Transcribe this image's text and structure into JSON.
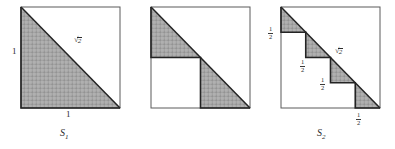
{
  "figure": {
    "background_color": "#ffffff",
    "ink_color": "#1a1a1a",
    "shade_color": "#9e9e9e",
    "outline_color": "#2b2b2b"
  },
  "glyphs": {
    "radical_sign": "√",
    "radicand": "2",
    "fraction_one": "1",
    "half_den": "2",
    "quarter_den": "4"
  },
  "panels": [
    {
      "id": "panel-1",
      "caption": "S",
      "caption_sub": "1",
      "square_side_label": "1",
      "labels": {
        "left_side": "1",
        "bottom_side": "1",
        "diagonal": "√2"
      },
      "steps": 1,
      "step_fraction_num": "1",
      "step_fraction_den": "1",
      "edge_labels": [
        {
          "name": "left-side-length",
          "text": "1",
          "kind": "integer",
          "x": 12,
          "y": 52
        },
        {
          "name": "bottom-side-length",
          "text": "1",
          "kind": "integer",
          "x": 68,
          "y": 114
        },
        {
          "name": "diagonal-length",
          "text": "√2",
          "kind": "radical",
          "x": 76,
          "y": 40
        }
      ],
      "caption_pos": {
        "x": 63,
        "y": 133
      }
    },
    {
      "id": "panel-2",
      "caption": "S",
      "caption_sub": "2",
      "square_side_label": "1",
      "labels": {
        "left_upper": "1/2",
        "interior_horizontal": "1/2",
        "interior_vertical": "1/2",
        "bottom_right": "1/2",
        "diagonal": "√2"
      },
      "steps": 2,
      "step_fraction_num": "1",
      "step_fraction_den": "2",
      "edge_labels": [
        {
          "name": "left-half-length",
          "text": "1/2",
          "kind": "fraction",
          "num": "1",
          "den": "2",
          "x": 140,
          "y": 28
        },
        {
          "name": "interior-horizontal-half",
          "text": "1/2",
          "kind": "fraction",
          "num": "1",
          "den": "2",
          "x": 172,
          "y": 61
        },
        {
          "name": "interior-vertical-half",
          "text": "1/2",
          "kind": "fraction",
          "num": "1",
          "den": "2",
          "x": 192,
          "y": 79
        },
        {
          "name": "bottom-right-half",
          "text": "1/2",
          "kind": "fraction",
          "num": "1",
          "den": "2",
          "x": 228,
          "y": 113
        },
        {
          "name": "diagonal-length",
          "text": "√2",
          "kind": "radical",
          "x": 207,
          "y": 51
        }
      ],
      "caption_pos": {
        "x": 190,
        "y": 133
      }
    },
    {
      "id": "panel-3",
      "caption": "S",
      "caption_sub": "3",
      "square_side_label": "1",
      "labels": {
        "diagonal": "√2"
      },
      "steps": 4,
      "step_fraction_num": "1",
      "step_fraction_den": "4",
      "edge_labels": [
        {
          "name": "step1-vertical-quarter",
          "text": "1/4",
          "kind": "fraction",
          "num": "1",
          "den": "4",
          "x": 271,
          "y": 20
        },
        {
          "name": "step1-horizontal-quarter",
          "text": "1/4",
          "kind": "fraction",
          "num": "1",
          "den": "4",
          "x": 290,
          "y": 41
        },
        {
          "name": "step2-vertical-quarter",
          "text": "1/4",
          "kind": "fraction",
          "num": "1",
          "den": "4",
          "x": 300,
          "y": 48
        },
        {
          "name": "step2-horizontal-quarter",
          "text": "1/4",
          "kind": "fraction",
          "num": "1",
          "den": "4",
          "x": 315,
          "y": 66
        },
        {
          "name": "step3-vertical-quarter",
          "text": "1/4",
          "kind": "fraction",
          "num": "1",
          "den": "4",
          "x": 325,
          "y": 73
        },
        {
          "name": "step3-horizontal-quarter",
          "text": "1/4",
          "kind": "fraction",
          "num": "1",
          "den": "4",
          "x": 340,
          "y": 90
        },
        {
          "name": "step4-vertical-quarter",
          "text": "1/4",
          "kind": "fraction",
          "num": "1",
          "den": "4",
          "x": 350,
          "y": 97
        },
        {
          "name": "step4-bottom-quarter",
          "text": "1/4",
          "kind": "fraction",
          "num": "1",
          "den": "4",
          "x": 355,
          "y": 113
        },
        {
          "name": "diagonal-length",
          "text": "√2",
          "kind": "radical",
          "x": 333,
          "y": 49
        }
      ],
      "caption_pos": {
        "x": 320,
        "y": 133
      }
    }
  ]
}
